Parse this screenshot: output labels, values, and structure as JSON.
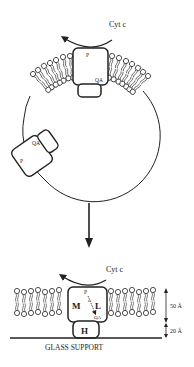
{
  "top_panel": {
    "cyt_label": "Cyt c",
    "protein_top": {
      "p_label": "P",
      "q_label": "QA"
    },
    "protein_left": {
      "p_label": "P",
      "q_label": "QA"
    }
  },
  "bottom_panel": {
    "cyt_label": "Cyt c",
    "subunit_m": "M",
    "subunit_l": "L",
    "subunit_h": "H",
    "p_label": "P",
    "electron_label": "e-",
    "q_label": "QA",
    "dim_membrane": "50 Å",
    "dim_gap": "20 Å",
    "support_label": "GLASS SUPPORT"
  },
  "colors": {
    "ink": "#222222",
    "background": "#ffffff"
  }
}
